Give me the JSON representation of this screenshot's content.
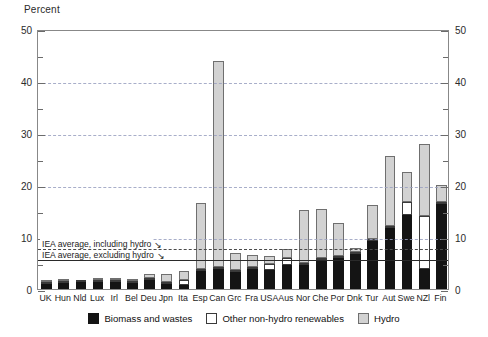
{
  "chart_data": {
    "type": "bar",
    "stacked": true,
    "title": "",
    "subtitle": "",
    "ylabel": "Percent",
    "xlabel": "",
    "ylim": [
      0,
      50
    ],
    "yticks": [
      0,
      10,
      20,
      30,
      40,
      50
    ],
    "yminorticks": [
      5,
      15,
      25,
      35,
      45
    ],
    "grid": true,
    "dual_axis": true,
    "legend_position": "bottom",
    "categories": [
      "UK",
      "Hun",
      "Nld",
      "Lux",
      "Irl",
      "Bel",
      "Deu",
      "Jpn",
      "Ita",
      "Esp",
      "Can",
      "Grc",
      "Fra",
      "USA",
      "Aus",
      "Nor",
      "Che",
      "Por",
      "Dnk",
      "Tur",
      "Aut",
      "Swe",
      "NZl",
      "Fin"
    ],
    "series": [
      {
        "name": "Biomass and wastes",
        "color": "#141414",
        "values": [
          0.9,
          1.2,
          1.3,
          1.3,
          1.4,
          1.2,
          1.8,
          1.0,
          0.8,
          3.4,
          3.8,
          3.3,
          3.9,
          3.6,
          4.6,
          4.6,
          5.6,
          6.0,
          6.8,
          9.2,
          11.8,
          14.3,
          3.8,
          16.3
        ]
      },
      {
        "name": "Other non-hydro renewables",
        "color": "#ffffff",
        "values": [
          0.2,
          0.2,
          0.2,
          0.2,
          0.2,
          0.2,
          0.4,
          0.3,
          1.0,
          0.4,
          0.2,
          0.3,
          0.2,
          1.2,
          1.4,
          0.2,
          0.2,
          0.2,
          0.4,
          0.3,
          0.2,
          2.4,
          10.2,
          0.2
        ]
      },
      {
        "name": "Hydro",
        "color": "#d2d2d2",
        "values": [
          0.1,
          0.1,
          0.0,
          0.1,
          0.2,
          0.1,
          0.6,
          1.6,
          1.6,
          12.8,
          39.7,
          3.2,
          2.3,
          1.6,
          1.7,
          10.2,
          9.4,
          6.3,
          0.6,
          6.5,
          13.4,
          5.8,
          13.8,
          3.3
        ]
      }
    ],
    "annotations": [
      {
        "label": "IEA average, including hydro",
        "value": 8.0,
        "style": "dashed"
      },
      {
        "label": "IEA average, excluding hydro",
        "value": 5.9,
        "style": "solid"
      }
    ]
  }
}
